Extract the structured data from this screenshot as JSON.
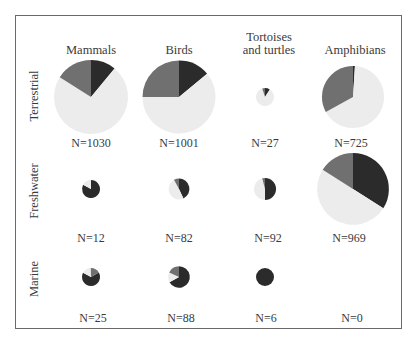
{
  "chart_data": {
    "type": "pie",
    "title": "",
    "layout": "grid of pie charts; rows = habitat, columns = taxon; pie area scaled to N",
    "columns": [
      "Mammals",
      "Birds",
      "Tortoises and turtles",
      "Amphibians"
    ],
    "rows": [
      "Terrestrial",
      "Freshwater",
      "Marine"
    ],
    "slice_order": [
      "dark",
      "light",
      "mid"
    ],
    "colors": {
      "dark": "#2b2b2b",
      "mid": "#707070",
      "light": "#ececec"
    },
    "pies": [
      {
        "row": "Terrestrial",
        "column": "Mammals",
        "N": 1030,
        "label": "N=1030",
        "fractions": {
          "dark": 0.11,
          "light": 0.73,
          "mid": 0.16
        }
      },
      {
        "row": "Terrestrial",
        "column": "Birds",
        "N": 1001,
        "label": "N=1001",
        "fractions": {
          "dark": 0.14,
          "light": 0.61,
          "mid": 0.25
        }
      },
      {
        "row": "Terrestrial",
        "column": "Tortoises and turtles",
        "N": 27,
        "label": "N=27",
        "fractions": {
          "dark": 0.09,
          "light": 0.86,
          "mid": 0.05
        }
      },
      {
        "row": "Terrestrial",
        "column": "Amphibians",
        "N": 725,
        "label": "N=725",
        "fractions": {
          "dark": 0.01,
          "light": 0.66,
          "mid": 0.33
        }
      },
      {
        "row": "Freshwater",
        "column": "Mammals",
        "N": 12,
        "label": "N=12",
        "fractions": {
          "dark": 0.83,
          "light": 0.17,
          "mid": 0.0
        }
      },
      {
        "row": "Freshwater",
        "column": "Birds",
        "N": 82,
        "label": "N=82",
        "fractions": {
          "dark": 0.43,
          "light": 0.49,
          "mid": 0.08
        }
      },
      {
        "row": "Freshwater",
        "column": "Tortoises and turtles",
        "N": 92,
        "label": "N=92",
        "fractions": {
          "dark": 0.5,
          "light": 0.46,
          "mid": 0.04
        }
      },
      {
        "row": "Freshwater",
        "column": "Amphibians",
        "N": 969,
        "label": "N=969",
        "fractions": {
          "dark": 0.34,
          "light": 0.5,
          "mid": 0.16
        }
      },
      {
        "row": "Marine",
        "column": "Mammals",
        "N": 25,
        "label": "N=25",
        "fractions": {
          "dark": 0.66,
          "light": 0.17,
          "mid": 0.17
        }
      },
      {
        "row": "Marine",
        "column": "Birds",
        "N": 88,
        "label": "N=88",
        "fractions": {
          "dark": 0.67,
          "light": 0.15,
          "mid": 0.18
        }
      },
      {
        "row": "Marine",
        "column": "Tortoises and turtles",
        "N": 6,
        "label": "N=6",
        "fractions": {
          "dark": 1.0,
          "light": 0.0,
          "mid": 0.0
        }
      },
      {
        "row": "Marine",
        "column": "Amphibians",
        "N": 0,
        "label": "N=0",
        "fractions": {
          "dark": 0,
          "light": 0,
          "mid": 0
        }
      }
    ]
  },
  "labels": {
    "columns": {
      "mammals": "Mammals",
      "birds": "Birds",
      "tortoises_line1": "Tortoises",
      "tortoises_line2": "and turtles",
      "amphibians": "Amphibians"
    },
    "rows": {
      "terrestrial": "Terrestrial",
      "freshwater": "Freshwater",
      "marine": "Marine"
    },
    "n": {
      "terrestrial": [
        "N=1030",
        "N=1001",
        "N=27",
        "N=725"
      ],
      "freshwater": [
        "N=12",
        "N=82",
        "N=92",
        "N=969"
      ],
      "marine": [
        "N=25",
        "N=88",
        "N=6",
        "N=0"
      ]
    }
  }
}
